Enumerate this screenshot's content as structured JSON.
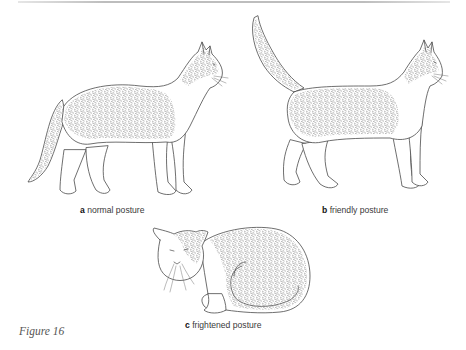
{
  "figure": {
    "label": "Figure 16",
    "panels": [
      {
        "letter": "a",
        "caption": "normal posture",
        "subject": "standing cat, tail lowered"
      },
      {
        "letter": "b",
        "caption": "friendly posture",
        "subject": "standing cat, tail raised upright"
      },
      {
        "letter": "c",
        "caption": "frightened posture",
        "subject": "crouching cat, tail curled around body"
      }
    ]
  },
  "colors": {
    "ink": "#4a4a4a",
    "caption_text": "#3a3a3a",
    "figure_label": "#555555",
    "rule": "#bdbdbd",
    "background": "#ffffff"
  }
}
